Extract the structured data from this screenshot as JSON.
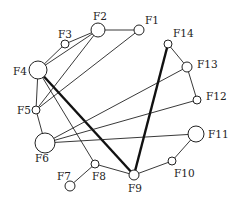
{
  "diagram": {
    "type": "network-graph",
    "nodes": [
      {
        "id": "F1",
        "label": "F1",
        "x": 139,
        "y": 30,
        "r": 5,
        "lx": 145,
        "ly": 24
      },
      {
        "id": "F2",
        "label": "F2",
        "x": 98,
        "y": 30,
        "r": 7,
        "lx": 93,
        "ly": 20
      },
      {
        "id": "F3",
        "label": "F3",
        "x": 65,
        "y": 44,
        "r": 4,
        "lx": 58,
        "ly": 38
      },
      {
        "id": "F4",
        "label": "F4",
        "x": 38,
        "y": 70,
        "r": 9,
        "lx": 13,
        "ly": 75
      },
      {
        "id": "F5",
        "label": "F5",
        "x": 36,
        "y": 110,
        "r": 4,
        "lx": 17,
        "ly": 114
      },
      {
        "id": "F6",
        "label": "F6",
        "x": 45,
        "y": 143,
        "r": 10,
        "lx": 35,
        "ly": 162
      },
      {
        "id": "F7",
        "label": "F7",
        "x": 70,
        "y": 186,
        "r": 5,
        "lx": 57,
        "ly": 180
      },
      {
        "id": "F8",
        "label": "F8",
        "x": 95,
        "y": 164,
        "r": 4,
        "lx": 92,
        "ly": 180
      },
      {
        "id": "F9",
        "label": "F9",
        "x": 134,
        "y": 175,
        "r": 5,
        "lx": 128,
        "ly": 192
      },
      {
        "id": "F10",
        "label": "F10",
        "x": 172,
        "y": 161,
        "r": 4,
        "lx": 174,
        "ly": 177
      },
      {
        "id": "F11",
        "label": "F11",
        "x": 196,
        "y": 134,
        "r": 8,
        "lx": 208,
        "ly": 138
      },
      {
        "id": "F12",
        "label": "F12",
        "x": 197,
        "y": 100,
        "r": 4,
        "lx": 206,
        "ly": 100
      },
      {
        "id": "F13",
        "label": "F13",
        "x": 187,
        "y": 67,
        "r": 5,
        "lx": 197,
        "ly": 68
      },
      {
        "id": "F14",
        "label": "F14",
        "x": 168,
        "y": 44,
        "r": 4,
        "lx": 173,
        "ly": 37
      }
    ],
    "edges": [
      {
        "from": "F1",
        "to": "F2",
        "weight": "normal"
      },
      {
        "from": "F1",
        "to": "F5",
        "weight": "normal"
      },
      {
        "from": "F2",
        "to": "F3",
        "weight": "normal"
      },
      {
        "from": "F2",
        "to": "F4",
        "weight": "normal"
      },
      {
        "from": "F2",
        "to": "F5",
        "weight": "normal"
      },
      {
        "from": "F3",
        "to": "F4",
        "weight": "normal"
      },
      {
        "from": "F4",
        "to": "F5",
        "weight": "normal"
      },
      {
        "from": "F4",
        "to": "F8",
        "weight": "normal"
      },
      {
        "from": "F4",
        "to": "F9",
        "weight": "thick"
      },
      {
        "from": "F5",
        "to": "F6",
        "weight": "normal"
      },
      {
        "from": "F6",
        "to": "F13",
        "weight": "normal"
      },
      {
        "from": "F6",
        "to": "F12",
        "weight": "normal"
      },
      {
        "from": "F6",
        "to": "F11",
        "weight": "normal"
      },
      {
        "from": "F7",
        "to": "F8",
        "weight": "normal"
      },
      {
        "from": "F8",
        "to": "F9",
        "weight": "normal"
      },
      {
        "from": "F9",
        "to": "F10",
        "weight": "normal"
      },
      {
        "from": "F9",
        "to": "F14",
        "weight": "thick"
      },
      {
        "from": "F10",
        "to": "F11",
        "weight": "normal"
      },
      {
        "from": "F12",
        "to": "F13",
        "weight": "normal"
      },
      {
        "from": "F13",
        "to": "F14",
        "weight": "normal"
      }
    ]
  }
}
